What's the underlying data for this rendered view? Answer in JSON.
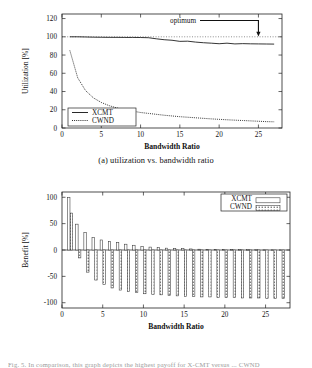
{
  "document": {
    "bottom_partial_text": "Fig. 5.  In comparison, this graph depicts the highest payoff for X-CMT versus ... CWND"
  },
  "figures": [
    {
      "id": "a",
      "caption": "(a) utilization vs. bandwidth ratio",
      "annotation": {
        "label": "optimum",
        "target_x": 25,
        "target_y": 100
      },
      "legend": [
        {
          "label": "XCMT",
          "style": "solid"
        },
        {
          "label": "CWND",
          "style": "dotted"
        }
      ]
    },
    {
      "id": "b",
      "caption": "(b) benefit vs. bandwidth ratio",
      "legend": [
        {
          "label": "XCMT",
          "style": "open-box"
        },
        {
          "label": "CWND",
          "style": "hatched-box"
        }
      ]
    }
  ],
  "chart_data": [
    {
      "type": "line",
      "title": "",
      "xlabel": "Bandwidth Ratio",
      "ylabel": "Utilization [%]",
      "xlim": [
        0,
        28
      ],
      "ylim": [
        0,
        125
      ],
      "xticks": [
        0,
        5,
        10,
        15,
        20,
        25
      ],
      "yticks": [
        0,
        20,
        40,
        60,
        80,
        100,
        120
      ],
      "grid": false,
      "legend_position": "lower-left",
      "reference_line": {
        "y": 100,
        "style": "dotted",
        "label": "optimum"
      },
      "x": [
        1,
        2,
        3,
        4,
        5,
        6,
        7,
        8,
        9,
        10,
        11,
        12,
        13,
        14,
        15,
        16,
        17,
        18,
        19,
        20,
        21,
        22,
        23,
        24,
        25,
        26,
        27
      ],
      "series": [
        {
          "name": "XCMT",
          "style": "solid",
          "values": [
            100,
            100,
            99.8,
            99.6,
            99.5,
            99.4,
            99.4,
            99.3,
            99.3,
            99.2,
            99.0,
            97.8,
            96.8,
            96.2,
            95.0,
            95.2,
            94.2,
            93.5,
            93.0,
            92.4,
            93.0,
            92.2,
            92.5,
            92.3,
            92.2,
            92.1,
            92.0
          ]
        },
        {
          "name": "CWND",
          "style": "dotted",
          "values": [
            85,
            55,
            41,
            33,
            28,
            24.5,
            22,
            20,
            18.5,
            17,
            16,
            15,
            14,
            13.2,
            12.4,
            11.8,
            11.2,
            10.6,
            10,
            9.5,
            9,
            8.6,
            8.2,
            7.8,
            7.4,
            7.0,
            6.8
          ]
        }
      ]
    },
    {
      "type": "bar",
      "title": "",
      "xlabel": "Bandwidth Ratio",
      "ylabel": "Benefit [%]",
      "xlim": [
        0,
        28
      ],
      "ylim": [
        -110,
        110
      ],
      "xticks": [
        0,
        5,
        10,
        15,
        20,
        25
      ],
      "yticks": [
        -100,
        -50,
        0,
        50,
        100
      ],
      "grid": false,
      "legend_position": "upper-right",
      "categories": [
        1,
        2,
        3,
        4,
        5,
        6,
        7,
        8,
        9,
        10,
        11,
        12,
        13,
        14,
        15,
        16,
        17,
        18,
        19,
        20,
        21,
        22,
        23,
        24,
        25,
        26,
        27
      ],
      "series": [
        {
          "name": "XCMT",
          "style": "open-box",
          "values": [
            100,
            49,
            33,
            24,
            19,
            16,
            14,
            11,
            9,
            7,
            5.5,
            4.5,
            3.5,
            3,
            2.5,
            2,
            1.5,
            1.3,
            1.1,
            1,
            0.9,
            0.8,
            0.7,
            0.6,
            0.5,
            0.5,
            0.4
          ]
        },
        {
          "name": "CWND",
          "style": "hatched-box",
          "values": [
            70,
            -15,
            -42,
            -57,
            -65,
            -72,
            -76,
            -79,
            -81,
            -83,
            -84,
            -85,
            -86,
            -87,
            -88,
            -88,
            -89,
            -89,
            -90,
            -90,
            -90,
            -91,
            -91,
            -91,
            -92,
            -92,
            -92
          ]
        }
      ]
    }
  ]
}
